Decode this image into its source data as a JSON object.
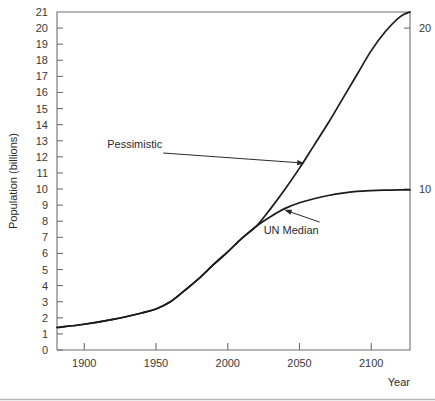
{
  "chart_data": {
    "type": "line",
    "title": "",
    "xlabel": "Year",
    "ylabel": "Population (billions)",
    "xlim": [
      1881,
      2127
    ],
    "ylim": [
      0,
      21
    ],
    "grid": false,
    "legend_position": "inline-annotations",
    "x_ticks": [
      1900,
      1950,
      2000,
      2050,
      2100
    ],
    "x_tick_labels": [
      "1900",
      "1950",
      "2000",
      "2050",
      "2100"
    ],
    "y_ticks": [
      0,
      1,
      2,
      3,
      4,
      5,
      6,
      7,
      8,
      9,
      10,
      11,
      12,
      13,
      14,
      15,
      16,
      17,
      18,
      19,
      20,
      21
    ],
    "y_tick_labels": [
      "0",
      "1",
      "2",
      "3",
      "4",
      "5",
      "6",
      "7",
      "8",
      "9",
      "10",
      "11",
      "12",
      "13",
      "14",
      "15",
      "16",
      "17",
      "18",
      "19",
      "20",
      "21"
    ],
    "right_axis_ticks": [
      10,
      20
    ],
    "right_axis_tick_labels": [
      "10",
      "20"
    ],
    "series": [
      {
        "name": "Pessimistic",
        "label": "Pessimistic",
        "color": "#1a1a1a",
        "x": [
          1881,
          1900,
          1920,
          1940,
          1950,
          1960,
          1970,
          1980,
          1990,
          2000,
          2010,
          2020,
          2030,
          2040,
          2050,
          2060,
          2070,
          2080,
          2090,
          2100,
          2110,
          2120,
          2127
        ],
        "values": [
          1.4,
          1.6,
          1.9,
          2.3,
          2.55,
          3.0,
          3.7,
          4.45,
          5.3,
          6.1,
          6.95,
          7.7,
          8.8,
          10.0,
          11.3,
          12.7,
          14.1,
          15.6,
          17.1,
          18.6,
          19.8,
          20.7,
          21.0
        ]
      },
      {
        "name": "UN Median",
        "label": "UN Median",
        "color": "#1a1a1a",
        "x": [
          1881,
          1900,
          1920,
          1940,
          1950,
          1960,
          1970,
          1980,
          1990,
          2000,
          2010,
          2020,
          2030,
          2040,
          2050,
          2060,
          2070,
          2080,
          2090,
          2100,
          2110,
          2120,
          2127
        ],
        "values": [
          1.4,
          1.6,
          1.9,
          2.3,
          2.55,
          3.0,
          3.7,
          4.45,
          5.3,
          6.1,
          6.95,
          7.7,
          8.3,
          8.8,
          9.15,
          9.4,
          9.6,
          9.75,
          9.85,
          9.9,
          9.93,
          9.95,
          9.95
        ]
      }
    ],
    "annotations": [
      {
        "text": "Pessimistic",
        "label_x": 1916,
        "label_y": 12.55,
        "target_x": 2055,
        "target_y": 11.6
      },
      {
        "text": "UN Median",
        "label_x": 2025,
        "label_y": 7.2,
        "target_x": 2038,
        "target_y": 8.75
      }
    ]
  }
}
